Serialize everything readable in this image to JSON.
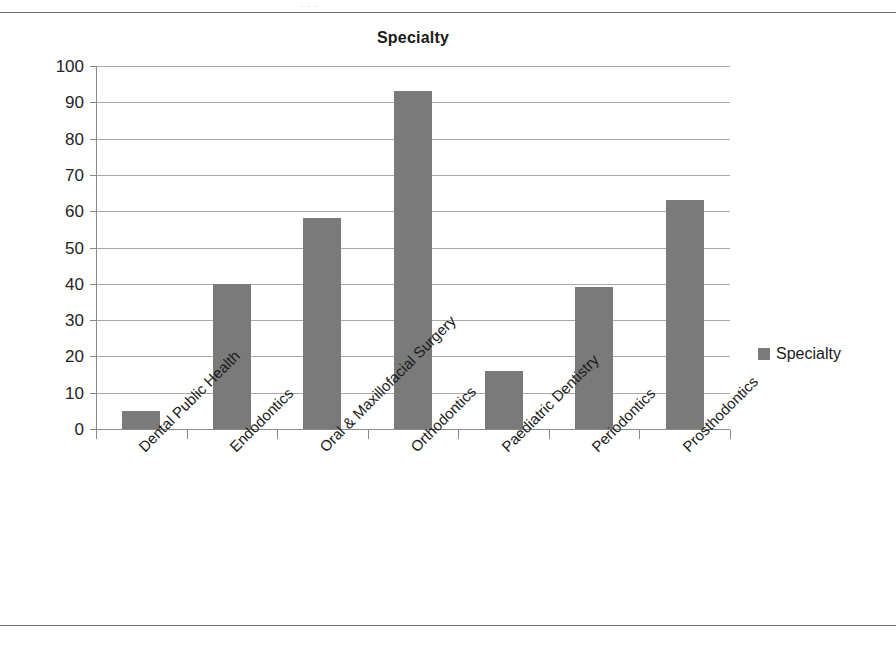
{
  "page": {
    "top_sliver_text": "· · ·"
  },
  "chart_data": {
    "type": "bar",
    "title": "Specialty",
    "xlabel": "",
    "ylabel": "",
    "ylim": [
      0,
      100
    ],
    "ytick_step": 10,
    "grid": true,
    "legend_position": "right",
    "bar_color": "#7a7a7a",
    "gridline_color": "#a8a8a8",
    "axis_color": "#8a8a8a",
    "categories": [
      "Dental Public Health",
      "Endodontics",
      "Oral & Maxillofacial Surgery",
      "Orthodontics",
      "Paediatric Dentistry",
      "Periodontics",
      "Prosthodontics"
    ],
    "values": [
      5,
      40,
      58,
      93,
      16,
      39,
      63
    ],
    "series": [
      {
        "name": "Specialty",
        "values": [
          5,
          40,
          58,
          93,
          16,
          39,
          63
        ]
      }
    ],
    "yticks": [
      0,
      10,
      20,
      30,
      40,
      50,
      60,
      70,
      80,
      90,
      100
    ],
    "ytick_labels": [
      "0",
      "10",
      "20",
      "30",
      "40",
      "50",
      "60",
      "70",
      "80",
      "90",
      "100"
    ],
    "legend": [
      {
        "label": "Specialty",
        "color": "#7a7a7a"
      }
    ]
  }
}
